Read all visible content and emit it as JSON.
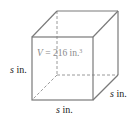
{
  "figure": {
    "shape": "cube",
    "volume_label": {
      "var": "V",
      "eq": " = 216 in.",
      "exp": "3"
    },
    "edge_labels": [
      {
        "id": "left",
        "var": "s",
        "unit": " in."
      },
      {
        "id": "depth",
        "var": "s",
        "unit": " in."
      },
      {
        "id": "bottom",
        "var": "s",
        "unit": " in."
      }
    ],
    "colors": {
      "edge": "#7a7a7a",
      "hidden_edge": "#9a9a9a",
      "text": "#222222",
      "volume_text": "#8a8a8a"
    }
  }
}
